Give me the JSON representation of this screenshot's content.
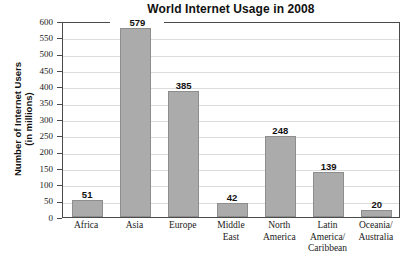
{
  "chart_data": {
    "type": "bar",
    "title": "World Internet Usage in 2008",
    "xlabel": "",
    "ylabel_lines": [
      "Number of Internet Users",
      "(in millions)"
    ],
    "ylabel": "Number of Internet Users (in millions)",
    "categories": [
      "Africa",
      "Asia",
      "Europe",
      "Middle East",
      "North America",
      "Latin America/ Caribbean",
      "Oceania/ Australia"
    ],
    "category_lines": [
      [
        "Africa"
      ],
      [
        "Asia"
      ],
      [
        "Europe"
      ],
      [
        "Middle",
        "East"
      ],
      [
        "North",
        "America"
      ],
      [
        "Latin",
        "America/",
        "Caribbean"
      ],
      [
        "Oceania/",
        "Australia"
      ]
    ],
    "values": [
      51,
      579,
      385,
      42,
      248,
      139,
      20
    ],
    "value_labels": [
      "51",
      "579",
      "385",
      "42",
      "248",
      "139",
      "20"
    ],
    "ylim": [
      0,
      600
    ],
    "ytick_step": 50,
    "yticks": [
      0,
      50,
      100,
      150,
      200,
      250,
      300,
      350,
      400,
      450,
      500,
      550,
      600
    ],
    "ytick_labels": [
      "0",
      "50",
      "100",
      "150",
      "200",
      "250",
      "300",
      "350",
      "400",
      "450",
      "500",
      "550",
      "600"
    ],
    "grid": true,
    "legend": false,
    "legend_position": "none",
    "colors": {
      "bar_fill": "#ababab",
      "bar_stroke": "#8d8d8d",
      "gridline": "#dcdcdc",
      "axis": "#4a4a4a",
      "text": "#111111",
      "background": "#ffffff"
    }
  }
}
